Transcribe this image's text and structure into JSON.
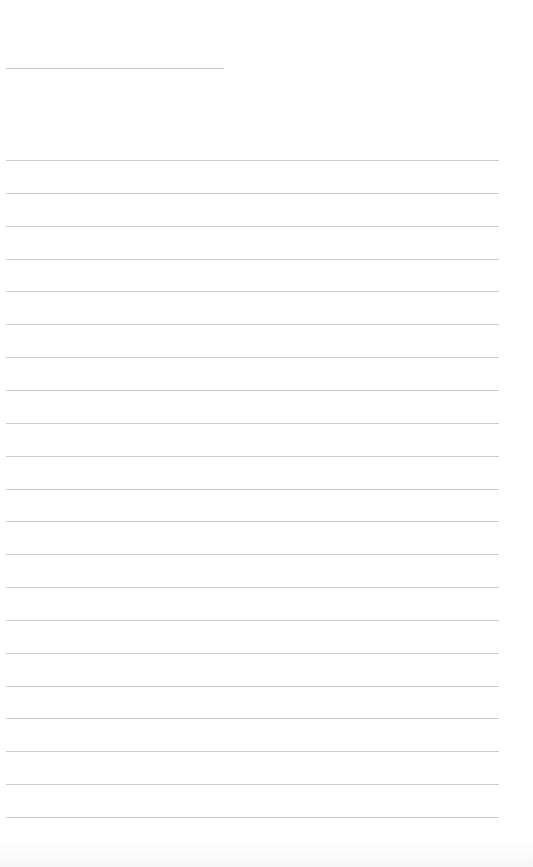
{
  "page": {
    "type": "blank lined paper",
    "background_color": "#fefefe",
    "line_color": "#cdcdcd"
  },
  "title_line": {
    "y": 68,
    "x_start": 6,
    "x_end": 224
  },
  "ruled_lines": {
    "count": 21,
    "first_y": 160,
    "spacing": 32.85,
    "x_start": 6,
    "x_end": 499
  }
}
